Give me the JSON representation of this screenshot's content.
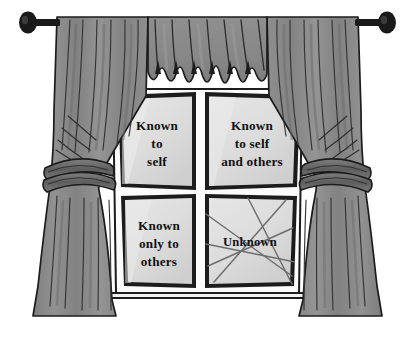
{
  "figure": {
    "type": "curtained-window-diagram",
    "background_color": "#ffffff"
  },
  "colors": {
    "curtain_fabric": "#8b8b8b",
    "curtain_fabric_light": "#9a9a9a",
    "curtain_fabric_dark": "#777777",
    "valance": "#8b8b8b",
    "tieback": "#6e6e6e",
    "rod": "#1a1a1a",
    "finial": "#1a1a1a",
    "glass": "#dcdcdc",
    "glass_highlight": "#e8e8e8",
    "frame_border": "#1c1c1c",
    "mullion": "#fdfdfd",
    "sill": "#1c1c1c",
    "fold_line": "#3a3a3a",
    "scribble": "#6a6a6a",
    "text": "#111111"
  },
  "rod": {
    "name": "curtain-rod",
    "left_finial": "finial-knob-left",
    "right_finial": "finial-knob-right"
  },
  "valance": {
    "name": "valance-swag",
    "pleat_count": 7
  },
  "curtains": {
    "left": {
      "name": "left-curtain",
      "tieback": "left-tieback"
    },
    "right": {
      "name": "right-curtain",
      "tieback": "right-tieback"
    }
  },
  "window": {
    "name": "window-frame",
    "sill": "window-sill",
    "panes": [
      {
        "id": "open-self",
        "position": "top-left",
        "lines": [
          "Known",
          "to",
          "self"
        ],
        "crossed_out": false
      },
      {
        "id": "public-self",
        "position": "top-right",
        "lines": [
          "Known",
          "to self",
          "and others"
        ],
        "crossed_out": false
      },
      {
        "id": "blind-self",
        "position": "bottom-left",
        "lines": [
          "Known",
          "only to",
          "others"
        ],
        "crossed_out": false
      },
      {
        "id": "unknown-self",
        "position": "bottom-right",
        "lines": [
          "Unknown"
        ],
        "crossed_out": true
      }
    ]
  }
}
